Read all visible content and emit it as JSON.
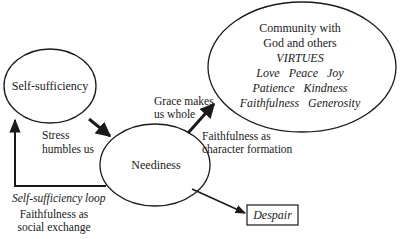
{
  "nodes": {
    "self_sufficiency": {
      "label": "Self-sufficiency"
    },
    "neediness": {
      "label": "Neediness"
    },
    "community": {
      "line1": "Community with",
      "line2": "God and others",
      "virtues_heading": "VIRTUES",
      "virtues_row1": "Love   Peace   Joy",
      "virtues_row2": "Patience   Kindness",
      "virtues_row3": "Faithfulness   Generosity"
    },
    "despair": {
      "label": "Despair"
    }
  },
  "edges": {
    "stress": {
      "line1": "Stress",
      "line2": "humbles us"
    },
    "grace": {
      "line1": "Grace makes",
      "line2": "us whole"
    },
    "character": {
      "line1": "Faithfulness as",
      "line2": "character formation"
    },
    "loop": {
      "title": "Self-sufficiency loop",
      "line1": "Faithfulness as",
      "line2": "social exchange"
    }
  },
  "colors": {
    "stroke": "#1a1a1a",
    "background": "#ffffff"
  }
}
